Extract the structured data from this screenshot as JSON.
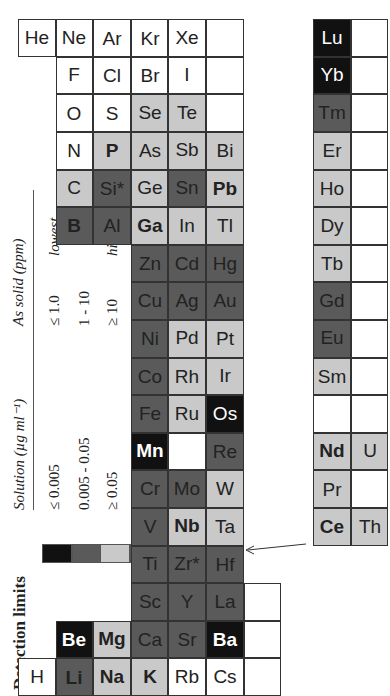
{
  "title": "Detection limits",
  "legend": {
    "col_solution": "Solution (µg ml⁻¹)",
    "col_solid": "As solid (ppm)",
    "rows": [
      {
        "level": 0,
        "color": "#111111",
        "solution": "≤ 0.005",
        "solid": "≤ 1.0",
        "note": "lowest"
      },
      {
        "level": 1,
        "color": "#5a5a5a",
        "solution": "0.005 - 0.05",
        "solid": "1 - 10",
        "note": ""
      },
      {
        "level": 2,
        "color": "#c9c9c9",
        "solution": "≥ 0.05",
        "solid": "≥ 10",
        "note": "highest"
      },
      {
        "level": 3,
        "color": "#ffffff",
        "solution": "Not normally measurable",
        "solid": "",
        "note": ""
      }
    ]
  },
  "elements": [
    {
      "sym": "H",
      "row": 0,
      "col": 0,
      "level": 3,
      "bold": false
    },
    {
      "sym": "He",
      "row": 0,
      "col": 17,
      "level": 3,
      "bold": false
    },
    {
      "sym": "Li",
      "row": 1,
      "col": 0,
      "level": 1,
      "bold": true
    },
    {
      "sym": "Be",
      "row": 1,
      "col": 1,
      "level": 0,
      "bold": true
    },
    {
      "sym": "B",
      "row": 1,
      "col": 12,
      "level": 1,
      "bold": true
    },
    {
      "sym": "C",
      "row": 1,
      "col": 13,
      "level": 2,
      "bold": false
    },
    {
      "sym": "N",
      "row": 1,
      "col": 14,
      "level": 3,
      "bold": false
    },
    {
      "sym": "O",
      "row": 1,
      "col": 15,
      "level": 3,
      "bold": false
    },
    {
      "sym": "F",
      "row": 1,
      "col": 16,
      "level": 3,
      "bold": false
    },
    {
      "sym": "Ne",
      "row": 1,
      "col": 17,
      "level": 3,
      "bold": false
    },
    {
      "sym": "Na",
      "row": 2,
      "col": 0,
      "level": 2,
      "bold": true
    },
    {
      "sym": "Mg",
      "row": 2,
      "col": 1,
      "level": 2,
      "bold": true
    },
    {
      "sym": "Al",
      "row": 2,
      "col": 12,
      "level": 1,
      "bold": false
    },
    {
      "sym": "Si*",
      "row": 2,
      "col": 13,
      "level": 1,
      "bold": false
    },
    {
      "sym": "P",
      "row": 2,
      "col": 14,
      "level": 2,
      "bold": true
    },
    {
      "sym": "S",
      "row": 2,
      "col": 15,
      "level": 3,
      "bold": false
    },
    {
      "sym": "Cl",
      "row": 2,
      "col": 16,
      "level": 3,
      "bold": false
    },
    {
      "sym": "Ar",
      "row": 2,
      "col": 17,
      "level": 3,
      "bold": false
    },
    {
      "sym": "K",
      "row": 3,
      "col": 0,
      "level": 2,
      "bold": true
    },
    {
      "sym": "Ca",
      "row": 3,
      "col": 1,
      "level": 1,
      "bold": false
    },
    {
      "sym": "Sc",
      "row": 3,
      "col": 2,
      "level": 1,
      "bold": false
    },
    {
      "sym": "Ti",
      "row": 3,
      "col": 3,
      "level": 1,
      "bold": false
    },
    {
      "sym": "V",
      "row": 3,
      "col": 4,
      "level": 1,
      "bold": false
    },
    {
      "sym": "Cr",
      "row": 3,
      "col": 5,
      "level": 1,
      "bold": false
    },
    {
      "sym": "Mn",
      "row": 3,
      "col": 6,
      "level": 0,
      "bold": true
    },
    {
      "sym": "Fe",
      "row": 3,
      "col": 7,
      "level": 1,
      "bold": false
    },
    {
      "sym": "Co",
      "row": 3,
      "col": 8,
      "level": 1,
      "bold": false
    },
    {
      "sym": "Ni",
      "row": 3,
      "col": 9,
      "level": 1,
      "bold": false
    },
    {
      "sym": "Cu",
      "row": 3,
      "col": 10,
      "level": 1,
      "bold": false
    },
    {
      "sym": "Zn",
      "row": 3,
      "col": 11,
      "level": 1,
      "bold": false
    },
    {
      "sym": "Ga",
      "row": 3,
      "col": 12,
      "level": 2,
      "bold": true
    },
    {
      "sym": "Ge",
      "row": 3,
      "col": 13,
      "level": 2,
      "bold": false
    },
    {
      "sym": "As",
      "row": 3,
      "col": 14,
      "level": 2,
      "bold": false
    },
    {
      "sym": "Se",
      "row": 3,
      "col": 15,
      "level": 2,
      "bold": false
    },
    {
      "sym": "Br",
      "row": 3,
      "col": 16,
      "level": 3,
      "bold": false
    },
    {
      "sym": "Kr",
      "row": 3,
      "col": 17,
      "level": 3,
      "bold": false
    },
    {
      "sym": "Rb",
      "row": 4,
      "col": 0,
      "level": 3,
      "bold": false
    },
    {
      "sym": "Sr",
      "row": 4,
      "col": 1,
      "level": 1,
      "bold": false
    },
    {
      "sym": "Y",
      "row": 4,
      "col": 2,
      "level": 1,
      "bold": false
    },
    {
      "sym": "Zr*",
      "row": 4,
      "col": 3,
      "level": 1,
      "bold": false
    },
    {
      "sym": "Nb",
      "row": 4,
      "col": 4,
      "level": 2,
      "bold": true
    },
    {
      "sym": "Mo",
      "row": 4,
      "col": 5,
      "level": 1,
      "bold": false
    },
    {
      "sym": "",
      "row": 4,
      "col": 6,
      "level": 3,
      "bold": false
    },
    {
      "sym": "Ru",
      "row": 4,
      "col": 7,
      "level": 2,
      "bold": false
    },
    {
      "sym": "Rh",
      "row": 4,
      "col": 8,
      "level": 2,
      "bold": false
    },
    {
      "sym": "Pd",
      "row": 4,
      "col": 9,
      "level": 2,
      "bold": false
    },
    {
      "sym": "Ag",
      "row": 4,
      "col": 10,
      "level": 1,
      "bold": false
    },
    {
      "sym": "Cd",
      "row": 4,
      "col": 11,
      "level": 1,
      "bold": false
    },
    {
      "sym": "In",
      "row": 4,
      "col": 12,
      "level": 2,
      "bold": false
    },
    {
      "sym": "Sn",
      "row": 4,
      "col": 13,
      "level": 1,
      "bold": false
    },
    {
      "sym": "Sb",
      "row": 4,
      "col": 14,
      "level": 2,
      "bold": false
    },
    {
      "sym": "Te",
      "row": 4,
      "col": 15,
      "level": 2,
      "bold": false
    },
    {
      "sym": "I",
      "row": 4,
      "col": 16,
      "level": 3,
      "bold": false
    },
    {
      "sym": "Xe",
      "row": 4,
      "col": 17,
      "level": 3,
      "bold": false
    },
    {
      "sym": "Cs",
      "row": 5,
      "col": 0,
      "level": 3,
      "bold": false
    },
    {
      "sym": "Ba",
      "row": 5,
      "col": 1,
      "level": 0,
      "bold": true
    },
    {
      "sym": "La",
      "row": 5,
      "col": 2,
      "level": 1,
      "bold": false
    },
    {
      "sym": "Hf",
      "row": 5,
      "col": 3,
      "level": 1,
      "bold": false
    },
    {
      "sym": "Ta",
      "row": 5,
      "col": 4,
      "level": 2,
      "bold": false
    },
    {
      "sym": "W",
      "row": 5,
      "col": 5,
      "level": 2,
      "bold": false
    },
    {
      "sym": "Re",
      "row": 5,
      "col": 6,
      "level": 1,
      "bold": false
    },
    {
      "sym": "Os",
      "row": 5,
      "col": 7,
      "level": 0,
      "bold": false
    },
    {
      "sym": "Ir",
      "row": 5,
      "col": 8,
      "level": 2,
      "bold": false
    },
    {
      "sym": "Pt",
      "row": 5,
      "col": 9,
      "level": 2,
      "bold": false
    },
    {
      "sym": "Au",
      "row": 5,
      "col": 10,
      "level": 1,
      "bold": false
    },
    {
      "sym": "Hg",
      "row": 5,
      "col": 11,
      "level": 1,
      "bold": false
    },
    {
      "sym": "Tl",
      "row": 5,
      "col": 12,
      "level": 2,
      "bold": false
    },
    {
      "sym": "Pb",
      "row": 5,
      "col": 13,
      "level": 2,
      "bold": true
    },
    {
      "sym": "Bi",
      "row": 5,
      "col": 14,
      "level": 2,
      "bold": false
    },
    {
      "sym": "",
      "row": 5,
      "col": 15,
      "level": 3,
      "bold": false
    },
    {
      "sym": "",
      "row": 5,
      "col": 16,
      "level": 3,
      "bold": false
    },
    {
      "sym": "",
      "row": 5,
      "col": 17,
      "level": 3,
      "bold": false
    },
    {
      "sym": "",
      "row": 6,
      "col": 0,
      "level": 3,
      "bold": false
    },
    {
      "sym": "",
      "row": 6,
      "col": 1,
      "level": 3,
      "bold": false
    },
    {
      "sym": "",
      "row": 6,
      "col": 2,
      "level": 3,
      "bold": false
    }
  ],
  "lanthanides": [
    {
      "sym": "Ce",
      "level": 2,
      "bold": true
    },
    {
      "sym": "Pr",
      "level": 2,
      "bold": false
    },
    {
      "sym": "Nd",
      "level": 2,
      "bold": true
    },
    {
      "sym": "",
      "level": 3,
      "bold": false
    },
    {
      "sym": "Sm",
      "level": 2,
      "bold": false
    },
    {
      "sym": "Eu",
      "level": 1,
      "bold": false
    },
    {
      "sym": "Gd",
      "level": 1,
      "bold": false
    },
    {
      "sym": "Tb",
      "level": 2,
      "bold": false
    },
    {
      "sym": "Dy",
      "level": 2,
      "bold": false
    },
    {
      "sym": "Ho",
      "level": 2,
      "bold": false
    },
    {
      "sym": "Er",
      "level": 2,
      "bold": false
    },
    {
      "sym": "Tm",
      "level": 1,
      "bold": false
    },
    {
      "sym": "Yb",
      "level": 0,
      "bold": false
    },
    {
      "sym": "Lu",
      "level": 0,
      "bold": false
    }
  ],
  "actinides": [
    {
      "sym": "Th",
      "level": 2,
      "bold": false
    },
    {
      "sym": "",
      "level": 3,
      "bold": false
    },
    {
      "sym": "U",
      "level": 2,
      "bold": false
    },
    {
      "sym": "",
      "level": 3,
      "bold": false
    },
    {
      "sym": "",
      "level": 3,
      "bold": false
    },
    {
      "sym": "",
      "level": 3,
      "bold": false
    },
    {
      "sym": "",
      "level": 3,
      "bold": false
    },
    {
      "sym": "",
      "level": 3,
      "bold": false
    },
    {
      "sym": "",
      "level": 3,
      "bold": false
    },
    {
      "sym": "",
      "level": 3,
      "bold": false
    },
    {
      "sym": "",
      "level": 3,
      "bold": false
    },
    {
      "sym": "",
      "level": 3,
      "bold": false
    },
    {
      "sym": "",
      "level": 3,
      "bold": false
    },
    {
      "sym": "",
      "level": 3,
      "bold": false
    }
  ]
}
